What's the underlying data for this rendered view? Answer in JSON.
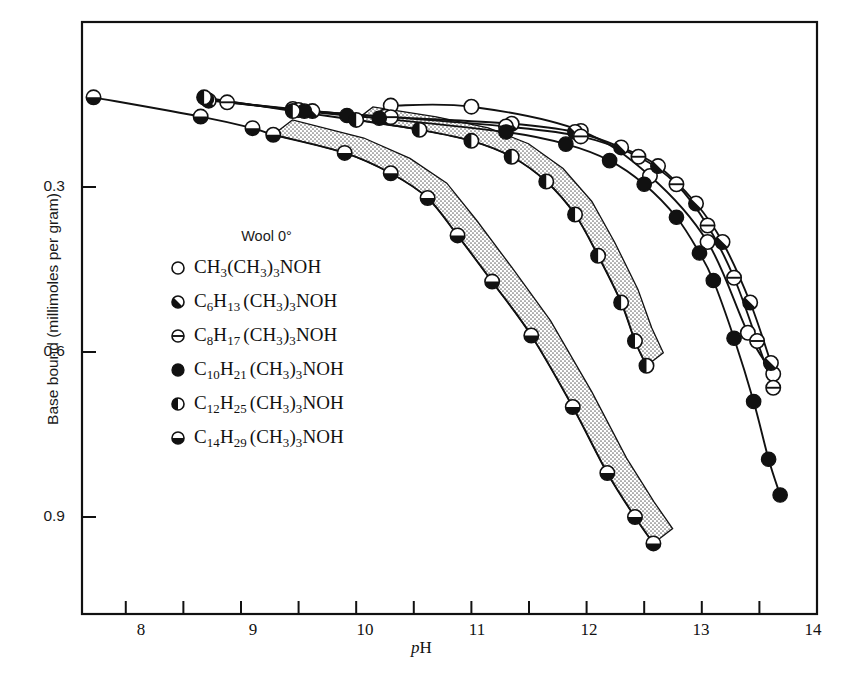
{
  "chart_data": {
    "type": "line",
    "title": "",
    "xlabel": "pH",
    "ylabel": "Base bound (millimoles per gram)",
    "xlim": [
      7.62,
      14.0
    ],
    "ylim": [
      0.915,
      0.12
    ],
    "y_inverted": true,
    "grid": false,
    "legend_position": "inner-left",
    "legend_title": "Wool 0°",
    "xticks": [
      8,
      9,
      10,
      11,
      12,
      13,
      14
    ],
    "xtick_labels": [
      "8",
      "9",
      "10",
      "11",
      "12",
      "13",
      "14"
    ],
    "xminorticks": [
      8.5,
      9.5,
      10.5,
      11.5,
      12.5,
      13.5
    ],
    "yticks": [
      0.3,
      0.6,
      0.9
    ],
    "ytick_labels": [
      "0.3",
      "0.6",
      "0.9"
    ],
    "shaded_bands": [
      {
        "name": "band-c12",
        "note": "stippled band along C12 curve"
      },
      {
        "name": "band-c14",
        "note": "stippled band along C14 curve"
      }
    ],
    "series": [
      {
        "name": "CH3(CH3)3NOH",
        "marker": "open-circle",
        "label": "CH_3(CH_3)_3NOH",
        "points": [
          {
            "x": 10.3,
            "y": 0.152
          },
          {
            "x": 11.0,
            "y": 0.154
          },
          {
            "x": 11.95,
            "y": 0.198
          },
          {
            "x": 12.55,
            "y": 0.28
          },
          {
            "x": 13.05,
            "y": 0.4
          },
          {
            "x": 13.4,
            "y": 0.565
          },
          {
            "x": 13.62,
            "y": 0.64
          }
        ]
      },
      {
        "name": "C6H13(CH3)3NOH",
        "marker": "half-diagonal",
        "label": "C_6H_13 (CH_3)_3NOH",
        "points": [
          {
            "x": 8.72,
            "y": 0.143
          },
          {
            "x": 9.45,
            "y": 0.158
          },
          {
            "x": 9.62,
            "y": 0.162
          },
          {
            "x": 10.25,
            "y": 0.172
          },
          {
            "x": 11.35,
            "y": 0.185
          },
          {
            "x": 11.9,
            "y": 0.2
          },
          {
            "x": 12.3,
            "y": 0.228
          },
          {
            "x": 12.62,
            "y": 0.262
          },
          {
            "x": 12.95,
            "y": 0.33
          },
          {
            "x": 13.18,
            "y": 0.4
          },
          {
            "x": 13.42,
            "y": 0.51
          },
          {
            "x": 13.6,
            "y": 0.62
          }
        ]
      },
      {
        "name": "C8H17(CH3)3NOH",
        "marker": "circle-hline",
        "label": "C_8H_17 (CH_3)_3NOH",
        "points": [
          {
            "x": 8.88,
            "y": 0.146
          },
          {
            "x": 9.5,
            "y": 0.16
          },
          {
            "x": 10.3,
            "y": 0.173
          },
          {
            "x": 11.3,
            "y": 0.19
          },
          {
            "x": 11.95,
            "y": 0.208
          },
          {
            "x": 12.45,
            "y": 0.245
          },
          {
            "x": 12.78,
            "y": 0.295
          },
          {
            "x": 13.05,
            "y": 0.37
          },
          {
            "x": 13.28,
            "y": 0.465
          },
          {
            "x": 13.48,
            "y": 0.58
          },
          {
            "x": 13.62,
            "y": 0.665
          }
        ]
      },
      {
        "name": "C10H21(CH3)3NOH",
        "marker": "filled-circle",
        "label": "C_10 H_21 (CH_3)_3NOH",
        "points": [
          {
            "x": 8.7,
            "y": 0.14
          },
          {
            "x": 9.55,
            "y": 0.162
          },
          {
            "x": 9.92,
            "y": 0.17
          },
          {
            "x": 10.2,
            "y": 0.175
          },
          {
            "x": 11.3,
            "y": 0.2
          },
          {
            "x": 11.82,
            "y": 0.222
          },
          {
            "x": 12.2,
            "y": 0.252
          },
          {
            "x": 12.5,
            "y": 0.295
          },
          {
            "x": 12.78,
            "y": 0.355
          },
          {
            "x": 12.98,
            "y": 0.42
          },
          {
            "x": 13.1,
            "y": 0.47
          },
          {
            "x": 13.28,
            "y": 0.575
          },
          {
            "x": 13.45,
            "y": 0.69
          },
          {
            "x": 13.58,
            "y": 0.795
          },
          {
            "x": 13.68,
            "y": 0.86
          }
        ]
      },
      {
        "name": "C12H25(CH3)3NOH",
        "marker": "half-left",
        "label": "C_12 H_25 (CH_3)_3NOH",
        "points": [
          {
            "x": 8.68,
            "y": 0.137
          },
          {
            "x": 9.45,
            "y": 0.162
          },
          {
            "x": 10.0,
            "y": 0.178
          },
          {
            "x": 10.55,
            "y": 0.196
          },
          {
            "x": 11.0,
            "y": 0.216
          },
          {
            "x": 11.35,
            "y": 0.245
          },
          {
            "x": 11.65,
            "y": 0.29
          },
          {
            "x": 11.9,
            "y": 0.35
          },
          {
            "x": 12.1,
            "y": 0.425
          },
          {
            "x": 12.3,
            "y": 0.51
          },
          {
            "x": 12.42,
            "y": 0.58
          },
          {
            "x": 12.52,
            "y": 0.625
          }
        ]
      },
      {
        "name": "C14H29(CH3)3NOH",
        "marker": "half-bottom",
        "label": "C_14 H_29 (CH_3)_3NOH",
        "points": [
          {
            "x": 7.72,
            "y": 0.137
          },
          {
            "x": 8.65,
            "y": 0.172
          },
          {
            "x": 9.1,
            "y": 0.193
          },
          {
            "x": 9.28,
            "y": 0.205
          },
          {
            "x": 9.9,
            "y": 0.238
          },
          {
            "x": 10.3,
            "y": 0.275
          },
          {
            "x": 10.62,
            "y": 0.32
          },
          {
            "x": 10.88,
            "y": 0.388
          },
          {
            "x": 11.18,
            "y": 0.472
          },
          {
            "x": 11.52,
            "y": 0.57
          },
          {
            "x": 11.88,
            "y": 0.7
          },
          {
            "x": 12.18,
            "y": 0.82
          },
          {
            "x": 12.42,
            "y": 0.9
          },
          {
            "x": 12.58,
            "y": 0.948
          }
        ]
      }
    ]
  },
  "axis": {
    "y_label": "Base bound (millimoles per gram)",
    "x_label_italic": "p",
    "x_label_rest": "H",
    "y_ticks": [
      "0.3",
      "0.6",
      "0.9"
    ],
    "x_ticks": [
      "8",
      "9",
      "10",
      "11",
      "12",
      "13",
      "14"
    ]
  },
  "legend": {
    "title": "Wool 0°",
    "items": [
      {
        "marker": "open-circle",
        "pre": "CH",
        "sub1": "3",
        "mid": "(CH",
        "sub2": "3",
        "mid2": ")",
        "sub3": "3",
        "post": "NOH",
        "spaced": false
      },
      {
        "marker": "half-diagonal",
        "pre": "C",
        "sub1": "6",
        "mid0": "H",
        "sub0b": "13",
        "mid": "(CH",
        "sub2": "3",
        "mid2": ")",
        "sub3": "3",
        "post": "NOH",
        "spaced": true
      },
      {
        "marker": "circle-hline",
        "pre": "C",
        "sub1": "8",
        "mid0": "H",
        "sub0b": "17",
        "mid": "(CH",
        "sub2": "3",
        "mid2": ")",
        "sub3": "3",
        "post": "NOH",
        "spaced": true
      },
      {
        "marker": "filled-circle",
        "pre": "C",
        "sub1": "10",
        "mid0": "H",
        "sub0b": "21",
        "mid": "(CH",
        "sub2": "3",
        "mid2": ")",
        "sub3": "3",
        "post": "NOH",
        "spaced": true
      },
      {
        "marker": "half-left",
        "pre": "C",
        "sub1": "12",
        "mid0": "H",
        "sub0b": "25",
        "mid": "(CH",
        "sub2": "3",
        "mid2": ")",
        "sub3": "3",
        "post": "NOH",
        "spaced": true
      },
      {
        "marker": "half-bottom",
        "pre": "C",
        "sub1": "14",
        "mid0": "H",
        "sub0b": "29",
        "mid": "(CH",
        "sub2": "3",
        "mid2": ")",
        "sub3": "3",
        "post": "NOH",
        "spaced": true
      }
    ]
  },
  "colors": {
    "ink": "#111111",
    "background": "#ffffff",
    "stipple": "#b9b9b9"
  }
}
